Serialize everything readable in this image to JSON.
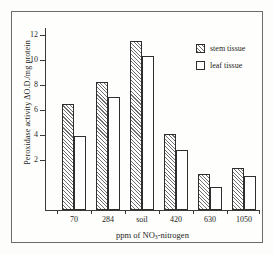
{
  "chart_data": {
    "type": "bar",
    "title": "",
    "xlabel": "ppm of NO3-nitrogen",
    "ylabel": "Peroxidase activity ΔO.D./mg protein",
    "categories": [
      "70",
      "284",
      "soil",
      "420",
      "630",
      "1050"
    ],
    "series": [
      {
        "name": "stem tissue",
        "values": [
          7.25,
          8.8,
          11.6,
          5.2,
          2.5,
          2.9
        ]
      },
      {
        "name": "leaf tissue",
        "values": [
          5.1,
          7.75,
          10.55,
          4.1,
          1.55,
          2.35
        ]
      }
    ],
    "ylim": [
      0,
      12.6
    ],
    "yticks": [
      2,
      4,
      6,
      8,
      10,
      12
    ],
    "ytick_labels": [
      "2",
      "4",
      "6",
      "8",
      "10",
      "12"
    ],
    "grid": false,
    "legend_position": "top-right"
  },
  "axes": {
    "y_title_prefix": "Peroxidase activity ",
    "y_title_symbol": "ΔO.D./mg protein",
    "x_title_prefix": "ppm of NO",
    "x_title_sub": "3",
    "x_title_suffix": "-nitrogen"
  },
  "legend": {
    "items": [
      {
        "label": "stem tissue",
        "swatch": "hatched-swatch"
      },
      {
        "label": "leaf tissue",
        "swatch": "white-swatch"
      }
    ]
  },
  "ticks": {
    "y": [
      "12",
      "10",
      "8",
      "6",
      "4",
      "2"
    ],
    "x": [
      "70",
      "284",
      "soil",
      "420",
      "630",
      "1050"
    ]
  }
}
